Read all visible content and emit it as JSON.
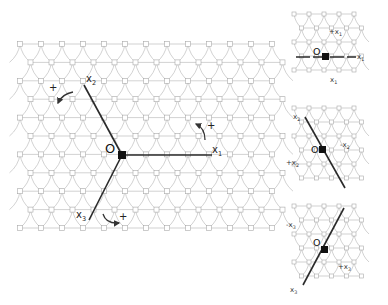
{
  "main_panel": {
    "origin_label": "O",
    "axes": [
      {
        "name": "x1",
        "label": "x",
        "subscript": "1",
        "rotation_sign": "+"
      },
      {
        "name": "x2",
        "label": "x",
        "subscript": "2",
        "rotation_sign": "+"
      },
      {
        "name": "x3",
        "label": "x",
        "subscript": "3",
        "rotation_sign": "+"
      }
    ]
  },
  "side_panels": [
    {
      "origin_label": "O",
      "axis": "x1",
      "labels": [
        {
          "text": "+x",
          "sub": "1"
        },
        {
          "text": "x",
          "sub": "1"
        },
        {
          "text": "x",
          "sub": "1"
        }
      ]
    },
    {
      "origin_label": "O",
      "axis": "x2",
      "labels": [
        {
          "text": "x",
          "sub": "2"
        },
        {
          "text": "-x",
          "sub": "2"
        },
        {
          "text": "+x",
          "sub": "2"
        }
      ]
    },
    {
      "origin_label": "O",
      "axis": "x3",
      "labels": [
        {
          "text": "-x",
          "sub": "3"
        },
        {
          "text": "+x",
          "sub": "3"
        },
        {
          "text": "x",
          "sub": "3"
        }
      ]
    }
  ]
}
